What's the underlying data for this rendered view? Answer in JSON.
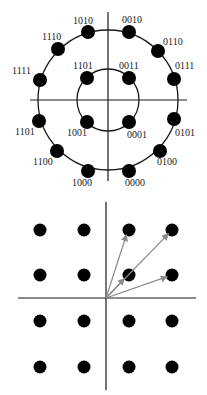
{
  "colors": {
    "background": "#ffffff",
    "axis": "#1a1a1a",
    "circle": "#1a1a1a",
    "point": "#000000",
    "vector": "#8a8a8a"
  },
  "top_diagram": {
    "type": "circular-constellation",
    "center": [
      108,
      100
    ],
    "axes": {
      "horizontal": [
        [
          30,
          100
        ],
        [
          187,
          100
        ]
      ],
      "vertical": [
        [
          108,
          12
        ],
        [
          108,
          181
        ]
      ]
    },
    "rings": [
      {
        "name": "outer-ring",
        "radius": 70
      },
      {
        "name": "inner-ring",
        "radius": 31
      }
    ],
    "point_radius": 7,
    "points": [
      {
        "label": "1010",
        "x": 88,
        "y": 32,
        "lx": 73,
        "ly": 24,
        "ring": "outer"
      },
      {
        "label": "0010",
        "x": 129,
        "y": 32,
        "lx": 122,
        "ly": 23,
        "ring": "outer"
      },
      {
        "label": "1110",
        "x": 58,
        "y": 49,
        "lx": 42,
        "ly": 40,
        "ring": "outer"
      },
      {
        "label": "0110",
        "x": 158,
        "y": 51,
        "lx": 163,
        "ly": 45,
        "ring": "outer"
      },
      {
        "label": "1111",
        "x": 40,
        "y": 80,
        "lx": 12,
        "ly": 74,
        "ring": "outer"
      },
      {
        "label": "0111",
        "x": 174,
        "y": 79,
        "lx": 175,
        "ly": 69,
        "ring": "outer"
      },
      {
        "label": "1101",
        "x": 39,
        "y": 121,
        "lx": 15,
        "ly": 135,
        "ring": "outer"
      },
      {
        "label": "0101",
        "x": 174,
        "y": 119,
        "lx": 175,
        "ly": 136,
        "ring": "outer"
      },
      {
        "label": "1100",
        "x": 57,
        "y": 151,
        "lx": 33,
        "ly": 165,
        "ring": "outer"
      },
      {
        "label": "0100",
        "x": 160,
        "y": 151,
        "lx": 157,
        "ly": 165,
        "ring": "outer"
      },
      {
        "label": "1000",
        "x": 88,
        "y": 171,
        "lx": 72,
        "ly": 186,
        "ring": "outer"
      },
      {
        "label": "0000",
        "x": 129,
        "y": 171,
        "lx": 125,
        "ly": 186,
        "ring": "outer"
      },
      {
        "label": "1101",
        "x": 87,
        "y": 78,
        "lx": 73,
        "ly": 69,
        "ring": "inner"
      },
      {
        "label": "0011",
        "x": 129,
        "y": 78,
        "lx": 119,
        "ly": 69,
        "ring": "inner"
      },
      {
        "label": "1001",
        "x": 87,
        "y": 122,
        "lx": 67,
        "ly": 136,
        "ring": "inner"
      },
      {
        "label": "0001",
        "x": 129,
        "y": 122,
        "lx": 127,
        "ly": 138,
        "ring": "inner"
      }
    ]
  },
  "bottom_diagram": {
    "type": "square-grid-constellation",
    "origin": [
      106,
      298
    ],
    "axes": {
      "horizontal": [
        [
          18,
          298
        ],
        [
          196,
          298
        ]
      ],
      "vertical": [
        [
          106,
          202
        ],
        [
          106,
          390
        ]
      ]
    },
    "point_radius": 6.5,
    "columns": [
      40,
      84,
      129,
      172
    ],
    "rows": [
      230,
      275,
      321,
      367
    ],
    "vectors": [
      {
        "to": [
          128,
          230
        ]
      },
      {
        "to": [
          172,
          230
        ]
      },
      {
        "to": [
          128,
          275
        ]
      },
      {
        "to": [
          172,
          275
        ]
      }
    ]
  }
}
